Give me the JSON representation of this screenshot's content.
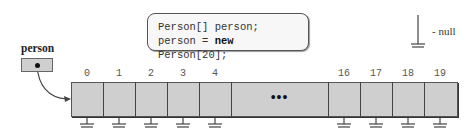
{
  "code": {
    "line1": "Person[] person;",
    "line2_prefix": "person = ",
    "line2_keyword": "new",
    "line2_suffix": " Person[20];"
  },
  "legend": {
    "symbol": "ground-null-icon",
    "label": "- null"
  },
  "variable": {
    "name": "person"
  },
  "array": {
    "length": 20,
    "visible_indices_left": [
      "0",
      "1",
      "2",
      "3",
      "4"
    ],
    "visible_indices_right": [
      "16",
      "17",
      "18",
      "19"
    ],
    "ellipsis": "•••",
    "cell_value": "null",
    "fill_color": "#cfcfcf"
  }
}
